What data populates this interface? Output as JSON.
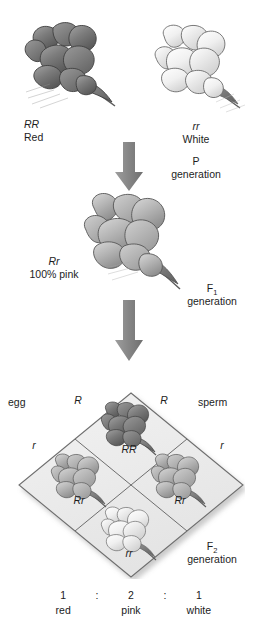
{
  "diagram": {
    "background_color": "#ffffff",
    "ink_color": "#1d1d1d",
    "arrow_color": "#8d8d8d",
    "punnett_fill": "#ededed",
    "punnett_stroke": "#6e6e6e"
  },
  "p_generation": {
    "parent_left": {
      "genotype": "RR",
      "phenotype": "Red",
      "flower_tone": "dark"
    },
    "parent_right": {
      "genotype": "rr",
      "phenotype": "White",
      "flower_tone": "light"
    },
    "label_line1": "P",
    "label_line2": "generation"
  },
  "f1_generation": {
    "genotype": "Rr",
    "phenotype": "100% pink",
    "label_prefix": "F",
    "label_subscript": "1",
    "label_line2": "generation",
    "flower_tone": "mid"
  },
  "f2_generation": {
    "label_prefix": "F",
    "label_subscript": "2",
    "label_line2": "generation",
    "gamete_source_left": "egg",
    "gamete_source_right": "sperm",
    "top_left_allele": "R",
    "top_right_allele": "R",
    "left_allele": "r",
    "right_allele": "r",
    "cells": [
      {
        "position": "top",
        "genotype": "RR",
        "phenotype": "red",
        "flower_tone": "dark"
      },
      {
        "position": "left",
        "genotype": "Rr",
        "phenotype": "pink",
        "flower_tone": "mid"
      },
      {
        "position": "right",
        "genotype": "Rr",
        "phenotype": "pink",
        "flower_tone": "mid"
      },
      {
        "position": "bottom",
        "genotype": "rr",
        "phenotype": "white",
        "flower_tone": "light"
      }
    ]
  },
  "ratio": {
    "separator": ":",
    "entries": [
      {
        "count": "1",
        "phenotype": "red"
      },
      {
        "count": "2",
        "phenotype": "pink"
      },
      {
        "count": "1",
        "phenotype": "white"
      }
    ]
  },
  "icons": {
    "arrow_p_to_f1": "down-arrow-icon",
    "arrow_f1_to_f2": "down-arrow-icon",
    "flower": "snapdragon-flower-icon"
  }
}
